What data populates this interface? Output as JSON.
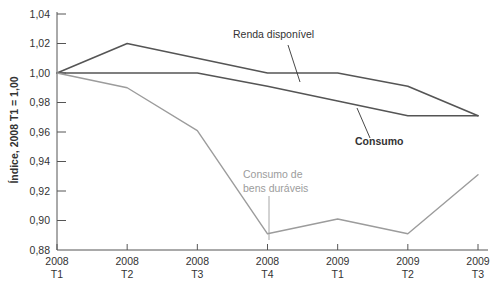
{
  "chart_data": {
    "type": "line",
    "title": "",
    "subtitle": "",
    "xlabel": "",
    "ylabel": "Índice, 2008 T1 = 1,00",
    "ylim": [
      0.88,
      1.04
    ],
    "yticks": [
      "0,88",
      "0,90",
      "0,92",
      "0,94",
      "0,96",
      "0,98",
      "1,00",
      "1,02",
      "1,04"
    ],
    "ytick_values": [
      0.88,
      0.9,
      0.92,
      0.94,
      0.96,
      0.98,
      1.0,
      1.02,
      1.04
    ],
    "grid": false,
    "legend_position": "inline-annotations",
    "categories": [
      "2008 T1",
      "2008 T2",
      "2008 T3",
      "2008 T4",
      "2009 T1",
      "2009 T2",
      "2009 T3"
    ],
    "x_tick_lines": [
      {
        "year": "2008",
        "quarter": "T1"
      },
      {
        "year": "2008",
        "quarter": "T2"
      },
      {
        "year": "2008",
        "quarter": "T3"
      },
      {
        "year": "2008",
        "quarter": "T4"
      },
      {
        "year": "2009",
        "quarter": "T1"
      },
      {
        "year": "2009",
        "quarter": "T2"
      },
      {
        "year": "2009",
        "quarter": "T3"
      }
    ],
    "series": [
      {
        "name": "Renda disponível",
        "color": "#555555",
        "width": 1.6,
        "values": [
          1.0,
          1.02,
          1.01,
          1.0,
          1.0,
          0.991,
          0.971
        ]
      },
      {
        "name": "Consumo",
        "color": "#555555",
        "width": 1.6,
        "values": [
          1.0,
          1.0,
          1.0,
          0.991,
          0.981,
          0.971,
          0.971
        ]
      },
      {
        "name": "Consumo de bens duráveis",
        "color": "#9c9c9c",
        "width": 1.4,
        "values": [
          1.0,
          0.99,
          0.961,
          0.891,
          0.901,
          0.891,
          0.931
        ]
      }
    ],
    "annotations": [
      {
        "id": "renda-disponivel",
        "text": "Renda disponível",
        "color": "#333333",
        "bold": false,
        "x": 233,
        "y": 38,
        "leader": {
          "x1": 288,
          "y1": 45,
          "x2": 300,
          "y2": 82
        }
      },
      {
        "id": "consumo",
        "text": "Consumo",
        "color": "#333333",
        "bold": true,
        "x": 355,
        "y": 145,
        "leader": {
          "x1": 370,
          "y1": 138,
          "x2": 357,
          "y2": 108
        }
      },
      {
        "id": "consumo-bens-duraveis",
        "line1": "Consumo de",
        "line2": "bens duráveis",
        "color": "#9c9c9c",
        "bold": false,
        "x": 243,
        "y": 178,
        "leader": {
          "x1": 269,
          "y1": 196,
          "x2": 269,
          "y2": 240
        }
      }
    ]
  },
  "axes": {
    "y_title": "Índice, 2008 T1 = 1,00",
    "axis_color": "#555555",
    "plot_bg": "#ffffff"
  }
}
